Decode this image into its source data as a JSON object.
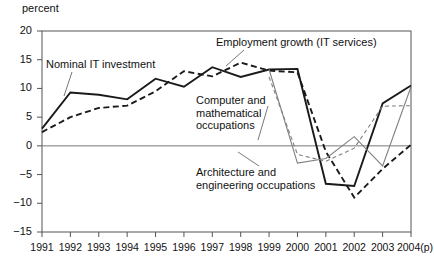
{
  "chart_data": {
    "type": "line",
    "title": "",
    "subtitle": "",
    "xlabel": "",
    "ylabel": "percent",
    "ylim": [
      -15,
      20
    ],
    "xlim": [
      1991,
      2004
    ],
    "grid": false,
    "legend_position": "inline-annotations",
    "zero_line": true,
    "y_ticks": [
      20,
      15,
      10,
      5,
      0,
      -5,
      -10,
      -15
    ],
    "y_tick_labels": [
      "20",
      "15",
      "10",
      "5",
      "0",
      "−5",
      "−10",
      "−15"
    ],
    "x": [
      1991,
      1992,
      1993,
      1994,
      1995,
      1996,
      1997,
      1998,
      1999,
      2000,
      2001,
      2002,
      2003,
      2004
    ],
    "x_tick_labels": [
      "1991",
      "1992",
      "1993",
      "1994",
      "1995",
      "1996",
      "1997",
      "1998",
      "1999",
      "2000",
      "2001",
      "2002",
      "2003",
      "2004(p)"
    ],
    "series": [
      {
        "name": "Nominal IT investment",
        "style": "solid",
        "color": "#1a1a1a",
        "width": 1.9,
        "values": [
          3.0,
          9.3,
          8.9,
          8.1,
          11.7,
          10.3,
          13.7,
          12.0,
          13.3,
          13.4,
          -6.6,
          -7.0,
          7.4,
          10.5
        ]
      },
      {
        "name": "Employment growth (IT services)",
        "style": "dashed",
        "color": "#1a1a1a",
        "width": 1.9,
        "values": [
          2.4,
          5.0,
          6.6,
          7.0,
          9.5,
          13.0,
          12.1,
          14.5,
          13.1,
          12.8,
          -1.0,
          -9.0,
          -4.0,
          0.2
        ]
      },
      {
        "name": "Computer and mathematical occupations",
        "style": "solid",
        "color": "#808080",
        "width": 1.1,
        "values": [
          null,
          null,
          null,
          null,
          null,
          null,
          null,
          null,
          13.3,
          -3.0,
          -2.2,
          1.6,
          -3.5,
          10.3
        ]
      },
      {
        "name": "Architecture and engineering occupations",
        "style": "dashed",
        "color": "#808080",
        "width": 1.1,
        "values": [
          null,
          null,
          null,
          null,
          null,
          null,
          null,
          null,
          12.0,
          -1.5,
          -2.7,
          -0.4,
          6.9,
          7.0
        ]
      }
    ],
    "annotations": [
      {
        "id": "nominal",
        "text": "Nominal IT investment"
      },
      {
        "id": "employment",
        "text": "Employment growth (IT services)"
      },
      {
        "id": "computer",
        "text": "Computer and\nmathematical\noccupations"
      },
      {
        "id": "architecture",
        "text": "Architecture and\nengineering occupations"
      }
    ],
    "axis_unit": "percent"
  }
}
